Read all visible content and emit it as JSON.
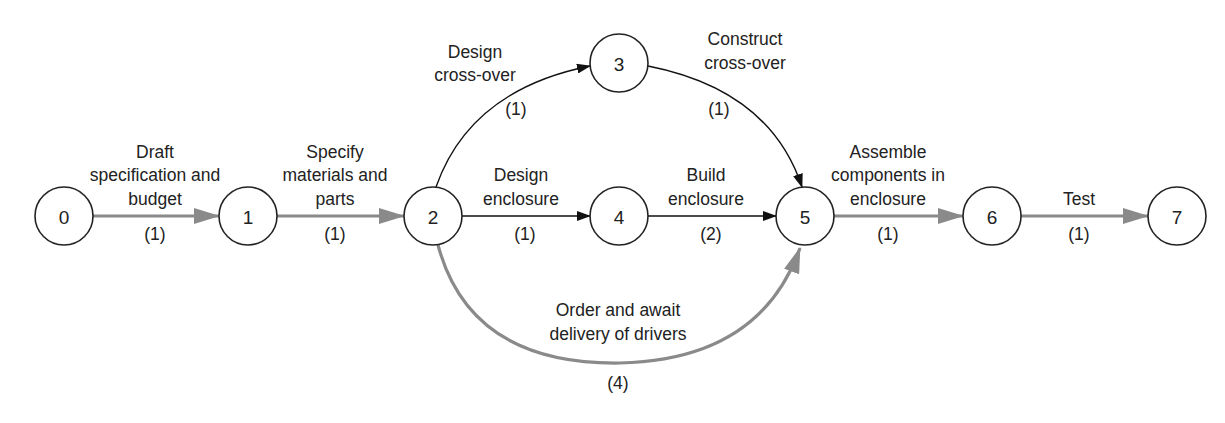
{
  "diagram": {
    "type": "activity-on-arrow network",
    "colors": {
      "critical_edge": "#8a8a8a",
      "normal_edge": "#111111",
      "node_stroke": "#222222"
    },
    "nodes": [
      {
        "id": "0",
        "label": "0",
        "x": 64,
        "y": 216
      },
      {
        "id": "1",
        "label": "1",
        "x": 248,
        "y": 216
      },
      {
        "id": "2",
        "label": "2",
        "x": 433,
        "y": 216
      },
      {
        "id": "3",
        "label": "3",
        "x": 619,
        "y": 63
      },
      {
        "id": "4",
        "label": "4",
        "x": 619,
        "y": 216
      },
      {
        "id": "5",
        "label": "5",
        "x": 805,
        "y": 216
      },
      {
        "id": "6",
        "label": "6",
        "x": 992,
        "y": 216
      },
      {
        "id": "7",
        "label": "7",
        "x": 1177,
        "y": 216
      }
    ],
    "edges": [
      {
        "from": "0",
        "to": "1",
        "critical": true,
        "label_lines": [
          "Draft",
          "specification and",
          "budget"
        ],
        "duration": "(1)"
      },
      {
        "from": "1",
        "to": "2",
        "critical": true,
        "label_lines": [
          "Specify",
          "materials and",
          "parts"
        ],
        "duration": "(1)"
      },
      {
        "from": "2",
        "to": "3",
        "critical": false,
        "label_lines": [
          "Design",
          "cross-over"
        ],
        "duration": "(1)"
      },
      {
        "from": "3",
        "to": "5",
        "critical": false,
        "label_lines": [
          "Construct",
          "cross-over"
        ],
        "duration": "(1)"
      },
      {
        "from": "2",
        "to": "4",
        "critical": false,
        "label_lines": [
          "Design",
          "enclosure"
        ],
        "duration": "(1)"
      },
      {
        "from": "4",
        "to": "5",
        "critical": false,
        "label_lines": [
          "Build",
          "enclosure"
        ],
        "duration": "(2)"
      },
      {
        "from": "2",
        "to": "5",
        "critical": true,
        "label_lines": [
          "Order and await",
          "delivery of drivers"
        ],
        "duration": "(4)"
      },
      {
        "from": "5",
        "to": "6",
        "critical": true,
        "label_lines": [
          "Assemble",
          "components in",
          "enclosure"
        ],
        "duration": "(1)"
      },
      {
        "from": "6",
        "to": "7",
        "critical": true,
        "label_lines": [
          "Test"
        ],
        "duration": "(1)"
      }
    ]
  }
}
